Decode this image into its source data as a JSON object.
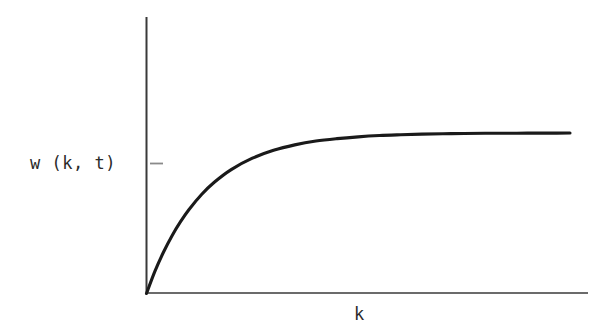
{
  "figure": {
    "background_color": "#ffffff",
    "ink_color": "#1a1a1a",
    "axis_color": "#3a3a3a",
    "tick_color": "#8a8a8a"
  },
  "labels": {
    "y_axis": "w (k, t)",
    "x_axis": "k"
  },
  "chart_data": {
    "type": "line",
    "title": "",
    "subtitle": "",
    "xlabel": "k",
    "ylabel": "w (k, t)",
    "legend": [],
    "grid": false,
    "annotations": [
      {
        "name": "y-axis-tick",
        "kind": "tick-mark",
        "axis": "y",
        "label": "",
        "y_fraction": 0.81
      }
    ],
    "axis_style": {
      "spines": [
        "left",
        "bottom"
      ],
      "x_ticks": [],
      "y_ticks": [],
      "x_tick_labels": [],
      "y_tick_labels": [],
      "arrowheads": false
    },
    "xlim": [
      0,
      1
    ],
    "ylim": [
      0,
      1.12
    ],
    "curve_model": "w = A * (1 - exp(-k / tau))",
    "curve_params": {
      "A": 1.0,
      "tau": 0.135
    },
    "x": [
      0,
      0.02,
      0.04,
      0.06,
      0.08,
      0.1,
      0.13,
      0.16,
      0.2,
      0.25,
      0.3,
      0.35,
      0.4,
      0.45,
      0.5,
      0.55,
      0.6,
      0.65,
      0.7,
      0.75,
      0.8,
      0.85,
      0.9,
      0.95,
      1.0
    ],
    "y": [
      0,
      0.139,
      0.257,
      0.359,
      0.446,
      0.522,
      0.617,
      0.693,
      0.772,
      0.843,
      0.892,
      0.926,
      0.95,
      0.965,
      0.976,
      0.984,
      0.989,
      0.993,
      0.995,
      0.997,
      0.998,
      0.998,
      0.999,
      0.999,
      1.0
    ]
  }
}
